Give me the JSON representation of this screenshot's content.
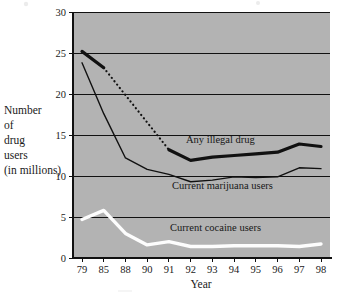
{
  "chart_data": {
    "type": "line",
    "title": "",
    "xlabel": "Year",
    "ylabel": "Number of drug users (in millions)",
    "ylabel_lines": [
      "Number",
      "of",
      "drug",
      "users",
      "(in millions)"
    ],
    "categories": [
      "79",
      "85",
      "88",
      "90",
      "91",
      "92",
      "93",
      "94",
      "95",
      "96",
      "97",
      "98"
    ],
    "x_tick_labels": [
      "79",
      "85",
      "88",
      "90",
      "91",
      "92",
      "93",
      "94",
      "95",
      "96",
      "97",
      "98"
    ],
    "y_tick_labels": [
      "0",
      "5",
      "10",
      "15",
      "20",
      "25",
      "30"
    ],
    "y_ticks": [
      0,
      5,
      10,
      15,
      20,
      25,
      30
    ],
    "ylim": [
      0,
      30
    ],
    "grid": true,
    "legend_position": "inline-annotations",
    "plot_background_color": "#b3b3b3",
    "series": [
      {
        "name": "Any illegal drug",
        "label": "Any illegal drug",
        "color": "#111111",
        "style": "thick-solid-with-dotted-gap",
        "linewidth": 3.2,
        "annotation_x": "91",
        "segments": [
          {
            "style": "solid",
            "x": [
              "79",
              "85"
            ],
            "values": [
              25.2,
              23.2
            ]
          },
          {
            "style": "dotted",
            "x": [
              "85",
              "91"
            ],
            "values": [
              23.2,
              13.2
            ]
          },
          {
            "style": "solid",
            "x": [
              "91",
              "92",
              "93",
              "94",
              "95",
              "96",
              "97",
              "98"
            ],
            "values": [
              13.2,
              11.9,
              12.3,
              12.5,
              12.7,
              12.9,
              13.9,
              13.6
            ]
          }
        ]
      },
      {
        "name": "Current marijuana users",
        "label": "Current marijuana users",
        "color": "#111111",
        "style": "thin-solid",
        "linewidth": 1.4,
        "x": [
          "79",
          "85",
          "88",
          "90",
          "91",
          "92",
          "93",
          "94",
          "95",
          "96",
          "97",
          "98"
        ],
        "values": [
          23.8,
          17.6,
          12.2,
          10.8,
          10.2,
          9.3,
          9.5,
          9.9,
          9.8,
          9.9,
          11.0,
          10.9
        ]
      },
      {
        "name": "Current cocaine users",
        "label": "Current cocaine users",
        "color": "#fdfdfd",
        "style": "thick-white",
        "linewidth": 3.4,
        "x": [
          "79",
          "85",
          "88",
          "90",
          "91",
          "92",
          "93",
          "94",
          "95",
          "96",
          "97",
          "98"
        ],
        "values": [
          4.7,
          5.8,
          3.0,
          1.6,
          2.0,
          1.4,
          1.4,
          1.5,
          1.5,
          1.5,
          1.4,
          1.7
        ]
      }
    ],
    "annotations": [
      {
        "text": "Any illegal drug",
        "series": "Any illegal drug",
        "x_px": 186,
        "y_px": 143
      },
      {
        "text": "Current marijuana users",
        "series": "Current marijuana users",
        "x_px": 172,
        "y_px": 189
      },
      {
        "text": "Current cocaine users",
        "series": "Current cocaine users",
        "x_px": 170,
        "y_px": 231
      }
    ]
  },
  "figure": {
    "background_color": "#ffffff",
    "text_color": "#1a1a1a",
    "plot_left_px": 73,
    "plot_right_px": 330,
    "plot_top_px": 12,
    "plot_bottom_px": 258
  }
}
